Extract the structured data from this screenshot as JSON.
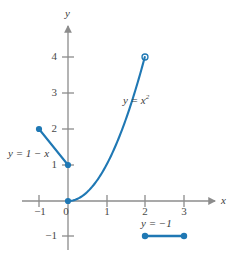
{
  "chart_data": {
    "type": "line",
    "title": "",
    "subtitle": "",
    "xlabel": "x",
    "ylabel": "y",
    "xlim": [
      -1.7,
      3.9
    ],
    "ylim": [
      -1.6,
      4.7
    ],
    "grid": false,
    "legend": "none",
    "x_ticks": [
      -1,
      0,
      1,
      2,
      3
    ],
    "x_tick_labels": [
      "−1",
      "0",
      "1",
      "2",
      "3"
    ],
    "y_ticks": [
      -1,
      1,
      2,
      3,
      4
    ],
    "y_tick_labels": [
      "−1",
      "1",
      "2",
      "3",
      "4"
    ],
    "series": [
      {
        "name": "y = 1 − x",
        "kind": "segment",
        "x": [
          -1,
          0
        ],
        "values": [
          2,
          1
        ],
        "endpoints": [
          {
            "x": -1,
            "y": 2,
            "marker": "filled"
          },
          {
            "x": 0,
            "y": 1,
            "marker": "filled"
          }
        ]
      },
      {
        "name": "y = x²",
        "kind": "curve",
        "x": [
          0,
          0.25,
          0.5,
          0.75,
          1,
          1.25,
          1.5,
          1.75,
          2
        ],
        "values": [
          0,
          0.0625,
          0.25,
          0.5625,
          1,
          1.5625,
          2.25,
          3.0625,
          4
        ],
        "endpoints": [
          {
            "x": 0,
            "y": 0,
            "marker": "filled"
          },
          {
            "x": 2,
            "y": 4,
            "marker": "open"
          }
        ]
      },
      {
        "name": "y = −1",
        "kind": "segment",
        "x": [
          2,
          3
        ],
        "values": [
          -1,
          -1
        ],
        "endpoints": [
          {
            "x": 2,
            "y": -1,
            "marker": "filled"
          },
          {
            "x": 3,
            "y": -1,
            "marker": "filled"
          }
        ]
      }
    ],
    "annotations": [
      {
        "text": "y = 1 − x",
        "x": -1.45,
        "y": 1.28
      },
      {
        "text": "y = x",
        "superscript": "2",
        "x": 1.35,
        "y": 2.78
      },
      {
        "text": "y = −1",
        "x": 2.18,
        "y": -0.62
      }
    ],
    "colors": {
      "curve": "#1f78b4",
      "axis": "#8c8c8c",
      "text": "#3a3a3a",
      "marker_fill": "#1f78b4",
      "marker_open_fill": "#ffffff"
    }
  },
  "axes": {
    "x_name": "x",
    "y_name": "y"
  },
  "labels": {
    "line_label": "y = 1 − x",
    "parabola_label_base": "y = x",
    "parabola_label_exp": "2",
    "constant_label": "y = −1"
  },
  "ticks": {
    "x": {
      "m1": "−1",
      "zero": "0",
      "p1": "1",
      "p2": "2",
      "p3": "3"
    },
    "y": {
      "m1": "−1",
      "p1": "1",
      "p2": "2",
      "p3": "3",
      "p4": "4"
    }
  }
}
